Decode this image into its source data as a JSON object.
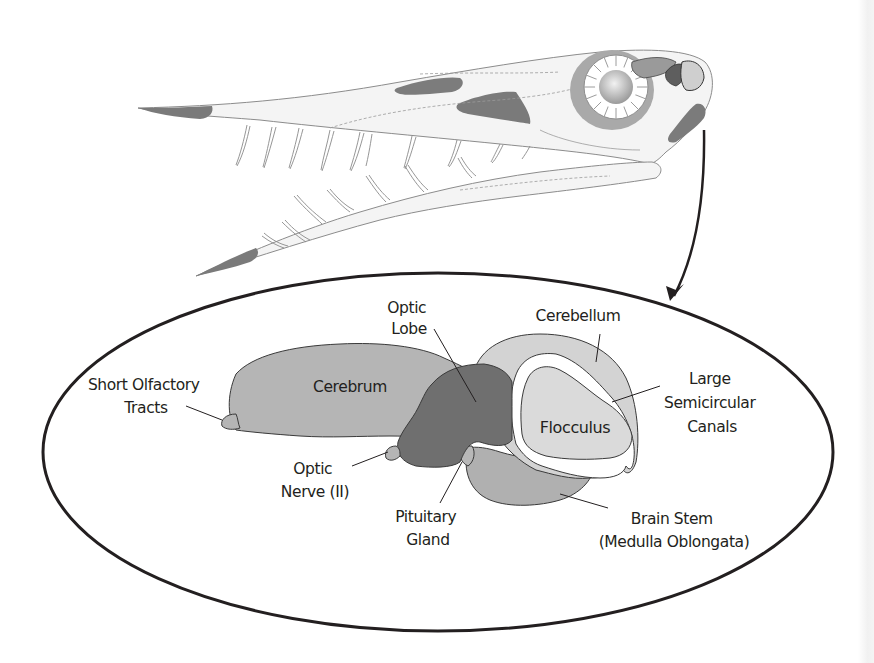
{
  "figure": {
    "colors": {
      "outline": "#231f20",
      "skull_fill": "#f3f3f3",
      "skull_line": "#8a8a8a",
      "dark_patch": "#7b7b7b",
      "eye_ring": "#a8a8a8",
      "cerebrum": "#b5b5b5",
      "optic_lobe": "#6f6f6f",
      "cerebellum": "#d4d4d4",
      "flocculus": "#dadada",
      "brain_stem": "#b0b0b0",
      "canal": "#ffffff"
    }
  },
  "labels": {
    "short_olfactory": [
      "Short Olfactory",
      "Tracts"
    ],
    "cerebrum": "Cerebrum",
    "optic_lobe": [
      "Optic",
      "Lobe"
    ],
    "cerebellum": "Cerebellum",
    "semicircular": [
      "Large",
      "Semicircular",
      "Canals"
    ],
    "flocculus": "Flocculus",
    "optic_nerve": [
      "Optic",
      "Nerve (II)"
    ],
    "pituitary": [
      "Pituitary",
      "Gland"
    ],
    "brain_stem": [
      "Brain Stem",
      "(Medulla Oblongata)"
    ]
  }
}
